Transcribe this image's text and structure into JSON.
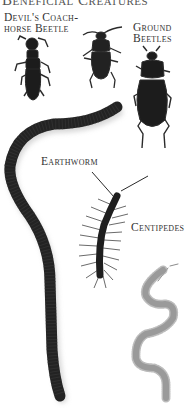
{
  "page": {
    "title": "Beneficial Creatures"
  },
  "labels": {
    "devils_coach_horse_line1": "Devil's Coach-",
    "devils_coach_horse_line2": "horse Beetle",
    "ground_beetles_line1": "Ground",
    "ground_beetles_line2": "Beetles",
    "earthworm": "Earthworm",
    "centipedes": "Centipedes"
  },
  "colors": {
    "background": "#ffffff",
    "insect_dark": "#1c1c1c",
    "centipede_light": "#8a8a8a",
    "text": "#333333"
  }
}
